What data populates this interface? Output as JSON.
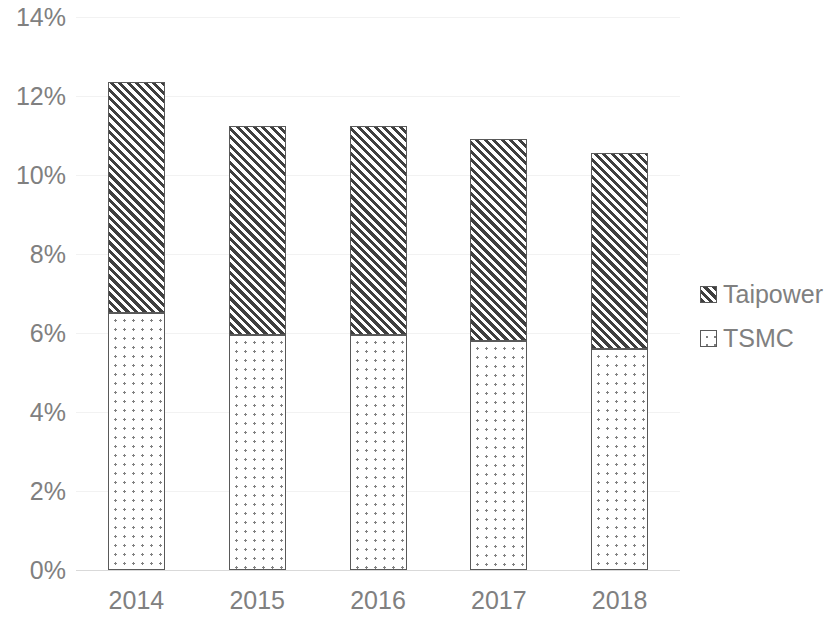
{
  "chart_data": {
    "type": "bar",
    "subtype": "stacked-column",
    "title": "",
    "subtitle": "",
    "xlabel": "",
    "ylabel": "",
    "categories": [
      "2014",
      "2015",
      "2016",
      "2017",
      "2018"
    ],
    "series": [
      {
        "name": "TSMC",
        "pattern": "dotted",
        "values": [
          6.5,
          5.95,
          5.95,
          5.8,
          5.6
        ]
      },
      {
        "name": "Taipower",
        "pattern": "diagonal-hatch",
        "values": [
          5.85,
          5.3,
          5.3,
          5.1,
          4.95
        ]
      }
    ],
    "stack_order": [
      "TSMC",
      "Taipower"
    ],
    "totals": [
      12.35,
      11.25,
      11.25,
      10.9,
      10.55
    ],
    "ylim": [
      0,
      14
    ],
    "ytick_values": [
      0,
      2,
      4,
      6,
      8,
      10,
      12,
      14
    ],
    "ytick_labels": [
      "0%",
      "2%",
      "4%",
      "6%",
      "8%",
      "10%",
      "12%",
      "14%"
    ],
    "unit": "%",
    "grid": true,
    "grid_axis": "y",
    "legend_position": "right",
    "legend_entries": [
      "Taipower",
      "TSMC"
    ],
    "colors": {
      "series_outline": "#595959",
      "taipower_hatch": "#3f3f3f",
      "tsmc_dots": "#808080",
      "gridline": "#f2f2f2",
      "axis_line": "#d9d9d9",
      "tick_text": "#808080",
      "background": "#ffffff"
    }
  }
}
